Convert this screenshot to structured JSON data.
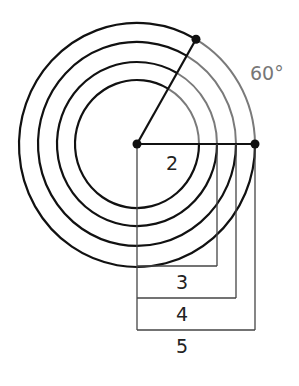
{
  "diagram": {
    "center": {
      "x": 137,
      "y": 144
    },
    "circles": [
      {
        "radius_label": "2",
        "r": 62
      },
      {
        "radius_label": "3",
        "r": 80
      },
      {
        "radius_label": "4",
        "r": 99
      },
      {
        "radius_label": "5",
        "r": 118
      }
    ],
    "angle_label": "60°",
    "labels": {
      "r2": "2",
      "r3": "3",
      "r4": "4",
      "r5": "5"
    },
    "colors": {
      "stroke": "#111111",
      "highlight_arc": "#7a7a7a",
      "bracket": "#444444"
    }
  }
}
